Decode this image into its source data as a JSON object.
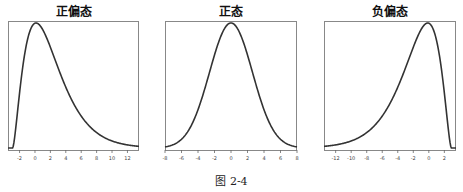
{
  "caption": "图 2-4",
  "chart_data": [
    {
      "type": "line",
      "title": "正偏态",
      "xlabel": "",
      "ylabel": "",
      "xlim": [
        -3.5,
        13.5
      ],
      "xticks": [
        -2,
        0,
        2,
        4,
        6,
        8,
        10,
        12
      ],
      "grid": false,
      "series": [
        {
          "name": "positive skew density",
          "shape": "skewed right",
          "mode": 2
        }
      ]
    },
    {
      "type": "line",
      "title": "正态",
      "xlabel": "",
      "ylabel": "",
      "xlim": [
        -8,
        8
      ],
      "xticks": [
        -8,
        -6,
        -4,
        -2,
        0,
        2,
        4,
        6,
        8
      ],
      "grid": false,
      "series": [
        {
          "name": "normal density",
          "shape": "symmetric",
          "mode": 0
        }
      ]
    },
    {
      "type": "line",
      "title": "负偏态",
      "xlabel": "",
      "ylabel": "",
      "xlim": [
        -13.5,
        3.5
      ],
      "xticks": [
        -12,
        -10,
        -8,
        -6,
        -4,
        -2,
        0,
        2
      ],
      "grid": false,
      "series": [
        {
          "name": "negative skew density",
          "shape": "skewed left",
          "mode": -2
        }
      ]
    }
  ],
  "panels": [
    {
      "title": "正偏态",
      "left": 8,
      "width": 131,
      "xmin": -3.5,
      "xmax": 13.5,
      "skew": 1,
      "ticks": [
        "-2",
        "0",
        "2",
        "4",
        "6",
        "8",
        "10",
        "12"
      ],
      "tickvals": [
        -2,
        0,
        2,
        4,
        6,
        8,
        10,
        12
      ]
    },
    {
      "title": "正态",
      "left": 165,
      "width": 132,
      "xmin": -8,
      "xmax": 8,
      "skew": 0,
      "ticks": [
        "-8",
        "-6",
        "-4",
        "-2",
        "0",
        "2",
        "4",
        "6",
        "8"
      ],
      "tickvals": [
        -8,
        -6,
        -4,
        -2,
        0,
        2,
        4,
        6,
        8
      ]
    },
    {
      "title": "负偏态",
      "left": 324,
      "width": 132,
      "xmin": -13.5,
      "xmax": 3.5,
      "skew": -1,
      "ticks": [
        "-12",
        "-10",
        "-8",
        "-6",
        "-4",
        "-2",
        "0",
        "2"
      ],
      "tickvals": [
        -12,
        -10,
        -8,
        -6,
        -4,
        -2,
        0,
        2
      ]
    }
  ]
}
